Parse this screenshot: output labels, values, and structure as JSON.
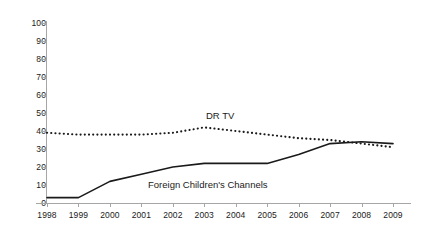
{
  "chart_data": {
    "type": "line",
    "title": "",
    "subtitle": "",
    "xlabel": "",
    "ylabel": "",
    "x": [
      1998,
      1999,
      2000,
      2001,
      2002,
      2003,
      2004,
      2005,
      2006,
      2007,
      2008,
      2009
    ],
    "xtick_labels": [
      "1998",
      "1999",
      "2000",
      "2001",
      "2002",
      "2003",
      "2004",
      "2005",
      "2006",
      "2007",
      "2008",
      "2009"
    ],
    "ytick_labels": [
      "0",
      "10",
      "20",
      "30",
      "40",
      "50",
      "60",
      "70",
      "80",
      "90",
      "100"
    ],
    "ytick_values": [
      0,
      10,
      20,
      30,
      40,
      50,
      60,
      70,
      80,
      90,
      100
    ],
    "ylim": [
      0,
      100
    ],
    "xlim": [
      1998,
      2009
    ],
    "grid": false,
    "legend_position": "inline-annotation",
    "series": [
      {
        "name": "DR TV",
        "style": "dotted",
        "color": "#1a1a1a",
        "values": [
          39,
          38,
          38,
          38,
          39,
          42,
          40,
          38,
          36,
          35,
          33,
          31
        ]
      },
      {
        "name": "Foreign Children's Channels",
        "style": "solid",
        "color": "#1a1a1a",
        "values": [
          3,
          3,
          12,
          16,
          20,
          22,
          22,
          22,
          27,
          33,
          34,
          33
        ]
      }
    ],
    "annotations": [
      {
        "text": "DR TV",
        "series": "DR TV"
      },
      {
        "text": "Foreign Children's Channels",
        "series": "Foreign Children's Channels"
      }
    ]
  },
  "axis": {
    "line_color": "#a6a6a6"
  }
}
